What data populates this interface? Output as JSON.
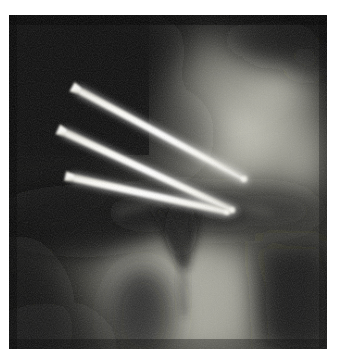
{
  "image": {
    "kind": "radiograph",
    "modality": "X-ray",
    "view": "anteroposterior hip / proximal femur",
    "width": 339,
    "height": 362,
    "border_color": "#ffffff",
    "plate": {
      "x": 9,
      "y": 15,
      "width": 318,
      "height": 334,
      "background_color": "#1c1c1c"
    },
    "tones": {
      "deep_shadow": "#0d0d0d",
      "shadow": "#262626",
      "mid_dark": "#44443f",
      "mid": "#6e6e66",
      "mid_light": "#8f8f86",
      "light": "#b0b0a6",
      "bright_bone": "#c8c8be",
      "metal_hardware": "#f2f0e6",
      "metal_highlight": "#ffffff"
    }
  },
  "anatomy": {
    "regions": [
      {
        "name": "soft-tissue-dark-field",
        "label": "Dark soft-tissue field (upper left)",
        "tone": "deep_shadow"
      },
      {
        "name": "acetabulum-iliac-bone",
        "label": "Bright cancellous bone mass (upper right)",
        "tone": "bright_bone"
      },
      {
        "name": "joint-space-notch",
        "label": "Dark joint space notch (center)",
        "tone": "shadow"
      },
      {
        "name": "femoral-shaft",
        "label": "Femoral shaft column (lower center)",
        "tone": "mid_light"
      },
      {
        "name": "medullary-canal",
        "label": "Darker medullary canal (lower center-left)",
        "tone": "mid_dark"
      },
      {
        "name": "lateral-cortex-shadow",
        "label": "Lateral cortical shadow band (lower right)",
        "tone": "shadow"
      },
      {
        "name": "superior-dark-blob",
        "label": "Dark lucency (top right)",
        "tone": "deep_shadow"
      }
    ]
  },
  "hardware": {
    "type": "cannulated screws / fixation pins",
    "count": 3,
    "orientation": "oblique, heads superolateral-left, tips inferomedial-right",
    "screws": [
      {
        "name": "screw-superior",
        "label": "Screw 1 (superior)",
        "head": {
          "x": 80,
          "y": 91
        },
        "tip": {
          "x": 244,
          "y": 179
        },
        "head_width": 11,
        "shaft_width": 7,
        "angle_deg": 28
      },
      {
        "name": "screw-middle",
        "label": "Screw 2 (middle)",
        "head": {
          "x": 66,
          "y": 133
        },
        "tip": {
          "x": 232,
          "y": 210
        },
        "head_width": 11,
        "shaft_width": 7,
        "angle_deg": 25
      },
      {
        "name": "screw-inferior",
        "label": "Screw 3 (inferior)",
        "head": {
          "x": 74,
          "y": 178
        },
        "tip": {
          "x": 227,
          "y": 212
        },
        "head_width": 10,
        "shaft_width": 7,
        "angle_deg": 13
      }
    ]
  },
  "annotations": {
    "markers": [],
    "text_overlays": [],
    "caption": ""
  }
}
